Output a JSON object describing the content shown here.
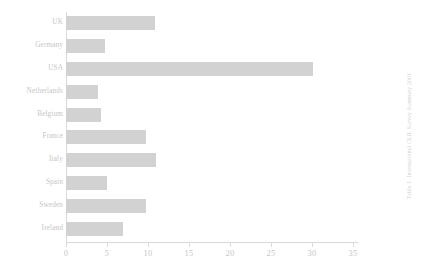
{
  "chart_data": {
    "type": "bar",
    "orientation": "horizontal",
    "title": "",
    "xlabel": "",
    "ylabel": "",
    "categories": [
      "UK",
      "Germany",
      "USA",
      "Netherlands",
      "Belgium",
      "France",
      "Italy",
      "Spain",
      "Sweden",
      "Ireland"
    ],
    "values": [
      10.8,
      4.8,
      30.1,
      3.9,
      4.3,
      9.8,
      11.0,
      5.0,
      9.8,
      6.9
    ],
    "xlim": [
      0,
      35.6
    ],
    "xticks": [
      0,
      5,
      10,
      15,
      20,
      25,
      30,
      35
    ],
    "xtick_labels": [
      "0",
      "5",
      "10",
      "15",
      "20",
      "25",
      "30",
      "35"
    ],
    "grid": false,
    "legend": false,
    "bar_color": "#d2d2d2",
    "axis_color": "#d9d9d9",
    "text_color": "#c6c6c6"
  },
  "side_caption": {
    "text": "Table 1. International CLIL Survey Summary 2001"
  }
}
